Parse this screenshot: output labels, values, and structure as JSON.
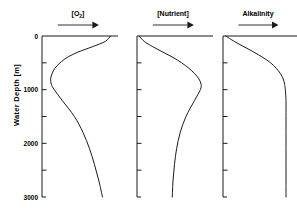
{
  "chart_data": {
    "type": "line",
    "title": "",
    "ylabel": "Water Depth [m]",
    "ylim": [
      0,
      3000
    ],
    "y_inverted": true,
    "ytick_values": [
      0,
      500,
      1000,
      1500,
      2000,
      2500,
      3000
    ],
    "ytick_labels": [
      "0",
      "",
      "1000",
      "",
      "2000",
      "",
      "3000"
    ],
    "grid": false,
    "legend": "none",
    "xlabel": "",
    "x_axis_note": "relative concentration, increasing to the right (no numeric scale shown)",
    "panels": [
      {
        "title": "[O2]",
        "title_text": "[O",
        "title_sub": "2",
        "title_tail": "]",
        "arrow_label": "increasing-right",
        "series_name": "dissolved oxygen",
        "depths": [
          0,
          100,
          200,
          300,
          400,
          500,
          600,
          700,
          800,
          900,
          1000,
          1200,
          1500,
          1800,
          2100,
          2400,
          2700,
          3000
        ],
        "values": [
          95,
          88,
          70,
          50,
          35,
          25,
          18,
          14,
          12,
          13,
          17,
          28,
          45,
          57,
          66,
          73,
          79,
          84
        ]
      },
      {
        "title": "[Nutrient]",
        "title_text": "[Nutrient]",
        "title_sub": "",
        "title_tail": "",
        "arrow_label": "increasing-right",
        "series_name": "nutrient concentration",
        "depths": [
          0,
          100,
          200,
          300,
          400,
          500,
          600,
          700,
          800,
          900,
          1000,
          1200,
          1500,
          1800,
          2100,
          2400,
          2700,
          3000
        ],
        "values": [
          3,
          10,
          22,
          36,
          50,
          62,
          72,
          80,
          86,
          89,
          88,
          80,
          68,
          60,
          55,
          52,
          50,
          49
        ]
      },
      {
        "title": "Alkalinity",
        "title_text": "Alkalinity",
        "title_sub": "",
        "title_tail": "",
        "arrow_label": "increasing-right",
        "series_name": "alkalinity",
        "depths": [
          0,
          100,
          200,
          300,
          400,
          500,
          600,
          700,
          800,
          900,
          1000,
          1200,
          1500,
          1800,
          2100,
          2400,
          2700,
          3000
        ],
        "values": [
          4,
          16,
          30,
          44,
          57,
          68,
          76,
          82,
          86,
          88,
          89,
          90,
          90,
          90,
          90,
          90,
          90,
          90
        ]
      }
    ]
  },
  "style": {
    "line_color": "#1a1a1a",
    "background": "#ffffff"
  }
}
